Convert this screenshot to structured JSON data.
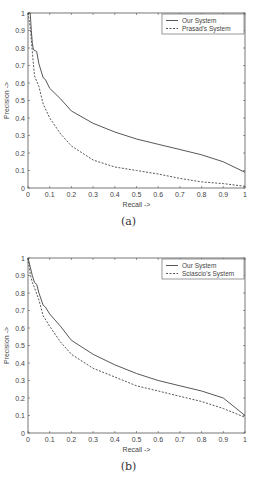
{
  "chart_data": [
    {
      "id": "a",
      "type": "line",
      "caption": "(a)",
      "title": "",
      "xlabel": "Recall ->",
      "ylabel": "Precision ->",
      "xlim": [
        0,
        1
      ],
      "ylim": [
        0,
        1
      ],
      "xticks": [
        "0",
        "0.1",
        "0.2",
        "0.3",
        "0.4",
        "0.5",
        "0.6",
        "0.7",
        "0.8",
        "0.9",
        "1"
      ],
      "yticks": [
        "0",
        "0.1",
        "0.2",
        "0.3",
        "0.4",
        "0.5",
        "0.6",
        "0.7",
        "0.8",
        "0.9",
        "1"
      ],
      "grid": false,
      "legend_position": "upper right",
      "series": [
        {
          "name": "Our System",
          "style": "solid",
          "x": [
            0,
            0.01,
            0.015,
            0.02,
            0.025,
            0.04,
            0.05,
            0.07,
            0.08,
            0.1,
            0.15,
            0.2,
            0.3,
            0.4,
            0.5,
            0.6,
            0.7,
            0.8,
            0.9,
            1.0
          ],
          "y": [
            1.0,
            1.0,
            0.9,
            0.83,
            0.79,
            0.78,
            0.71,
            0.63,
            0.62,
            0.57,
            0.51,
            0.44,
            0.37,
            0.32,
            0.28,
            0.25,
            0.22,
            0.19,
            0.15,
            0.09
          ]
        },
        {
          "name": "Prasad's System",
          "style": "dashed",
          "x": [
            0,
            0.01,
            0.02,
            0.03,
            0.05,
            0.07,
            0.1,
            0.15,
            0.2,
            0.3,
            0.4,
            0.5,
            0.6,
            0.7,
            0.8,
            0.9,
            1.0
          ],
          "y": [
            1.0,
            0.92,
            0.78,
            0.64,
            0.58,
            0.48,
            0.4,
            0.31,
            0.24,
            0.16,
            0.12,
            0.1,
            0.08,
            0.055,
            0.035,
            0.025,
            0.01
          ]
        }
      ]
    },
    {
      "id": "b",
      "type": "line",
      "caption": "(b)",
      "title": "",
      "xlabel": "Recall ->",
      "ylabel": "Precision ->",
      "xlim": [
        0,
        1
      ],
      "ylim": [
        0,
        1
      ],
      "xticks": [
        "0",
        "0.1",
        "0.2",
        "0.3",
        "0.4",
        "0.5",
        "0.6",
        "0.7",
        "0.8",
        "0.9",
        "1"
      ],
      "yticks": [
        "0",
        "0.1",
        "0.2",
        "0.3",
        "0.4",
        "0.5",
        "0.6",
        "0.7",
        "0.8",
        "0.9",
        "1"
      ],
      "grid": false,
      "legend_position": "upper right",
      "series": [
        {
          "name": "Our System",
          "style": "solid",
          "x": [
            0,
            0.01,
            0.02,
            0.03,
            0.04,
            0.05,
            0.07,
            0.08,
            0.1,
            0.15,
            0.2,
            0.3,
            0.4,
            0.5,
            0.6,
            0.7,
            0.8,
            0.9,
            1.0
          ],
          "y": [
            1.0,
            0.95,
            0.9,
            0.86,
            0.85,
            0.8,
            0.73,
            0.72,
            0.68,
            0.61,
            0.53,
            0.45,
            0.39,
            0.34,
            0.3,
            0.27,
            0.24,
            0.2,
            0.1
          ]
        },
        {
          "name": "Sciascio's System",
          "style": "dashed",
          "x": [
            0,
            0.01,
            0.02,
            0.03,
            0.05,
            0.07,
            0.1,
            0.15,
            0.2,
            0.3,
            0.4,
            0.5,
            0.6,
            0.7,
            0.8,
            0.9,
            1.0
          ],
          "y": [
            1.0,
            0.91,
            0.86,
            0.83,
            0.76,
            0.67,
            0.61,
            0.52,
            0.45,
            0.37,
            0.32,
            0.27,
            0.24,
            0.21,
            0.18,
            0.14,
            0.09
          ]
        }
      ]
    }
  ],
  "colors": {
    "line": "#444444",
    "axis": "#555555",
    "background": "#ffffff"
  }
}
